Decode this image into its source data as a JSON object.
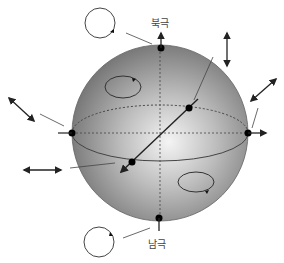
{
  "labels": {
    "north_pole": "북극",
    "south_pole": "남극"
  },
  "colors": {
    "sphere_light": "#f2f2f2",
    "sphere_mid": "#a8a8a8",
    "sphere_dark": "#6e6e6e",
    "line": "#333333",
    "dot": "#000000"
  },
  "sphere": {
    "cx": 160,
    "cy": 133,
    "r": 88
  },
  "elements": {
    "north_pole_dot": "north-pole",
    "south_pole_dot": "south-pole",
    "left_equator_dot": "equator-left",
    "right_equator_dot": "equator-right",
    "axis_dot_upper": "axis-upper",
    "axis_dot_lower": "axis-lower"
  }
}
